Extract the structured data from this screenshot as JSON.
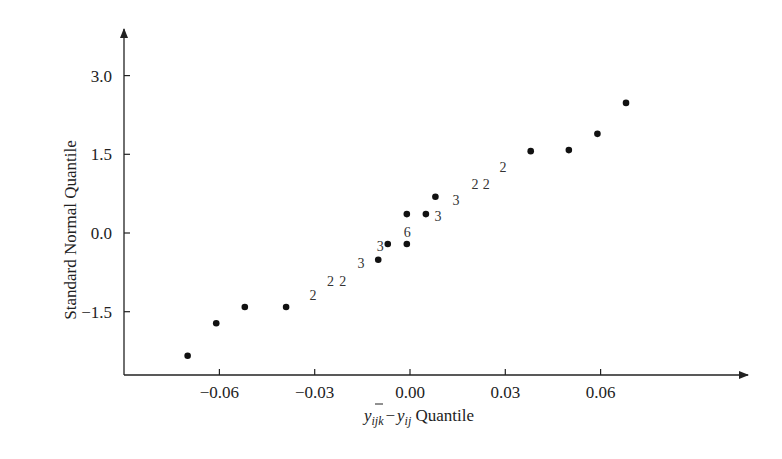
{
  "chart_data": {
    "type": "scatter",
    "title": "",
    "xlabel": "y_ijk − ȳ_ij Quantile",
    "xlabel_parts": {
      "base1": "y",
      "sub1": "ijk",
      "minus": "−",
      "base2": "y",
      "sub2": "ij",
      "suffix": " Quantile"
    },
    "ylabel": "Standard Normal Quantile",
    "xlim": [
      -0.0772,
      0.105
    ],
    "ylim": [
      -2.7,
      3.9
    ],
    "grid": false,
    "legend": null,
    "x_ticks": [
      {
        "value": -0.06,
        "label": "−0.06"
      },
      {
        "value": -0.03,
        "label": "−0.03"
      },
      {
        "value": 0.0,
        "label": "0.00"
      },
      {
        "value": 0.03,
        "label": "0.03"
      },
      {
        "value": 0.06,
        "label": "0.06"
      }
    ],
    "y_ticks": [
      {
        "value": 3.0,
        "label": "3.0"
      },
      {
        "value": 1.5,
        "label": "1.5"
      },
      {
        "value": 0.0,
        "label": "0.0"
      },
      {
        "value": -1.5,
        "label": "-1.5"
      }
    ],
    "points": [
      {
        "x": -0.07,
        "y": -2.34
      },
      {
        "x": -0.061,
        "y": -1.72
      },
      {
        "x": -0.052,
        "y": -1.41
      },
      {
        "x": -0.039,
        "y": -1.41
      },
      {
        "x": -0.01,
        "y": -0.51
      },
      {
        "x": -0.007,
        "y": -0.21
      },
      {
        "x": -0.001,
        "y": -0.21
      },
      {
        "x": -0.001,
        "y": 0.36
      },
      {
        "x": 0.005,
        "y": 0.36
      },
      {
        "x": 0.008,
        "y": 0.69
      },
      {
        "x": 0.038,
        "y": 1.56
      },
      {
        "x": 0.05,
        "y": 1.58
      },
      {
        "x": 0.059,
        "y": 1.89
      },
      {
        "x": 0.068,
        "y": 2.48
      }
    ],
    "count_labels": [
      {
        "x": -0.0305,
        "y": -1.18,
        "text": "2"
      },
      {
        "x": -0.025,
        "y": -0.91,
        "text": "2"
      },
      {
        "x": -0.0212,
        "y": -0.91,
        "text": "2"
      },
      {
        "x": -0.0154,
        "y": -0.57,
        "text": "3"
      },
      {
        "x": -0.0094,
        "y": -0.25,
        "text": "3"
      },
      {
        "x": -0.0009,
        "y": 0.02,
        "text": "6"
      },
      {
        "x": 0.0088,
        "y": 0.32,
        "text": "3"
      },
      {
        "x": 0.0145,
        "y": 0.63,
        "text": "3"
      },
      {
        "x": 0.0205,
        "y": 0.93,
        "text": "2"
      },
      {
        "x": 0.024,
        "y": 0.93,
        "text": "2"
      },
      {
        "x": 0.0293,
        "y": 1.26,
        "text": "2"
      }
    ]
  },
  "colors": {
    "axis": "#222222",
    "points": "#111111",
    "background": "#ffffff"
  }
}
